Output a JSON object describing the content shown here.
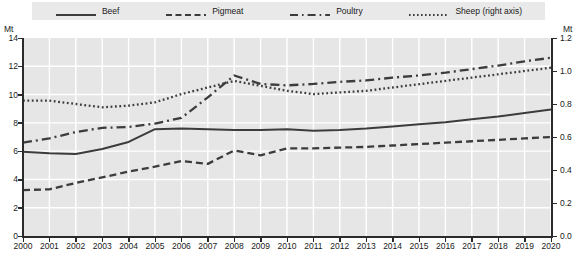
{
  "legend": {
    "items": [
      {
        "label": "Beef",
        "key": "solid-line-key",
        "color": "#3c3c3c"
      },
      {
        "label": "Pigmeat",
        "key": "dashed-line-key",
        "color": "#3c3c3c"
      },
      {
        "label": "Poultry",
        "key": "dash-dot-line-key",
        "color": "#3c3c3c"
      },
      {
        "label": "Sheep (right axis)",
        "key": "dotted-line-key",
        "color": "#3c3c3c"
      }
    ]
  },
  "axes": {
    "left_unit": "Mt",
    "right_unit": "Mt",
    "left_ticks": [
      "14",
      "12",
      "10",
      "8",
      "6",
      "4",
      "2",
      "0"
    ],
    "right_ticks": [
      "1.2",
      "1.0",
      "0.8",
      "0.6",
      "0.4",
      "0.2",
      "0.0"
    ]
  },
  "chart_data": {
    "type": "line",
    "title": "",
    "subtitle": "",
    "xlabel": "",
    "ylabel": "Mt",
    "y2label": "Mt",
    "ylim": [
      0,
      14
    ],
    "y2lim": [
      0.0,
      1.2
    ],
    "grid": true,
    "legend_position": "top",
    "x": [
      2000,
      2001,
      2002,
      2003,
      2004,
      2005,
      2006,
      2007,
      2008,
      2009,
      2010,
      2011,
      2012,
      2013,
      2014,
      2015,
      2016,
      2017,
      2018,
      2019,
      2020
    ],
    "categories": [
      "2000",
      "2001",
      "2002",
      "2003",
      "2004",
      "2005",
      "2006",
      "2007",
      "2008",
      "2009",
      "2010",
      "2011",
      "2012",
      "2013",
      "2014",
      "2015",
      "2016",
      "2017",
      "2018",
      "2019",
      "2020"
    ],
    "series": [
      {
        "name": "Beef",
        "axis": "left",
        "style": "solid",
        "values": [
          5.95,
          5.85,
          5.8,
          6.15,
          6.65,
          7.55,
          7.6,
          7.55,
          7.5,
          7.5,
          7.55,
          7.45,
          7.5,
          7.6,
          7.75,
          7.9,
          8.05,
          8.25,
          8.45,
          8.7,
          8.95
        ]
      },
      {
        "name": "Pigmeat",
        "axis": "left",
        "style": "dashed",
        "values": [
          3.25,
          3.3,
          3.75,
          4.15,
          4.55,
          4.9,
          5.3,
          5.1,
          6.05,
          5.7,
          6.2,
          6.2,
          6.25,
          6.3,
          6.4,
          6.5,
          6.6,
          6.7,
          6.8,
          6.9,
          7.0
        ]
      },
      {
        "name": "Poultry",
        "axis": "left",
        "style": "dash-dot",
        "values": [
          6.6,
          6.9,
          7.35,
          7.65,
          7.7,
          7.95,
          8.35,
          9.8,
          11.35,
          10.75,
          10.65,
          10.75,
          10.9,
          11.0,
          11.2,
          11.35,
          11.55,
          11.8,
          12.05,
          12.35,
          12.6
        ]
      },
      {
        "name": "Sheep (right axis)",
        "axis": "right",
        "style": "dotted",
        "values": [
          0.82,
          0.82,
          0.8,
          0.78,
          0.79,
          0.81,
          0.86,
          0.9,
          0.94,
          0.91,
          0.88,
          0.86,
          0.87,
          0.88,
          0.9,
          0.92,
          0.94,
          0.96,
          0.98,
          1.0,
          1.02
        ]
      }
    ]
  },
  "colors": {
    "plot_background": "#e6e6e6",
    "gridline": "#ffffff",
    "axis": "#2b2b2b",
    "legend_background": "#e9e9e9",
    "series": "#3c3c3c"
  }
}
